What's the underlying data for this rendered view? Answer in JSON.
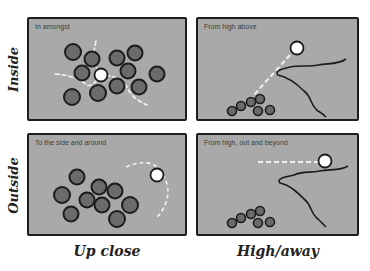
{
  "figure": {
    "top_title_fragment": "",
    "rows": [
      {
        "label": "Inside"
      },
      {
        "label": "Outside"
      }
    ],
    "columns": [
      {
        "label": "Up close"
      },
      {
        "label": "High/away"
      }
    ],
    "panels": [
      {
        "id": "inside-upclose",
        "caption": "In amongst"
      },
      {
        "id": "inside-high",
        "caption": "From high above"
      },
      {
        "id": "outside-upclose",
        "caption": "To the side and around"
      },
      {
        "id": "outside-high",
        "caption": "From high, out and beyond"
      }
    ]
  },
  "colors": {
    "panel_fill": "#a9a9a9",
    "panel_border": "#1d1d1d",
    "subject_fill": "#6b6b6b",
    "camera_fill": "#ffffff",
    "path_dash": "#ffffff"
  }
}
